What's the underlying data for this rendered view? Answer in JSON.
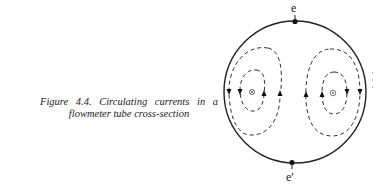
{
  "caption": {
    "line1": "Figure 4.4. Circulating currents in a",
    "line2": "flowmeter tube cross-section",
    "full": "Figure 4.4. Circulating currents in a flowmeter tube cross-section"
  },
  "diagram": {
    "title": "Circulating currents in a flowmeter tube cross-section",
    "tube": {
      "cx": 295,
      "cy": 92,
      "r": 71,
      "stroke": "#222222"
    },
    "electrodes": [
      {
        "label": "e",
        "position": "top",
        "x": 295,
        "y": 21
      },
      {
        "label": "e′",
        "position": "bottom",
        "x": 292,
        "y": 163
      }
    ],
    "markers": [
      {
        "symbol": "⊗",
        "meaning": "flow into page",
        "x": 252,
        "y": 92
      },
      {
        "symbol": "⊙",
        "meaning": "flow out of page",
        "x": 333,
        "y": 93
      }
    ],
    "loops": [
      {
        "name": "left-outer",
        "dashed": true,
        "arrows": [
          "down",
          "up"
        ]
      },
      {
        "name": "left-inner",
        "dashed": true,
        "arrows": [
          "down",
          "up"
        ]
      },
      {
        "name": "right-outer",
        "dashed": true,
        "arrows": [
          "up",
          "down"
        ]
      },
      {
        "name": "right-inner",
        "dashed": true,
        "arrows": [
          "up",
          "down"
        ]
      }
    ]
  }
}
